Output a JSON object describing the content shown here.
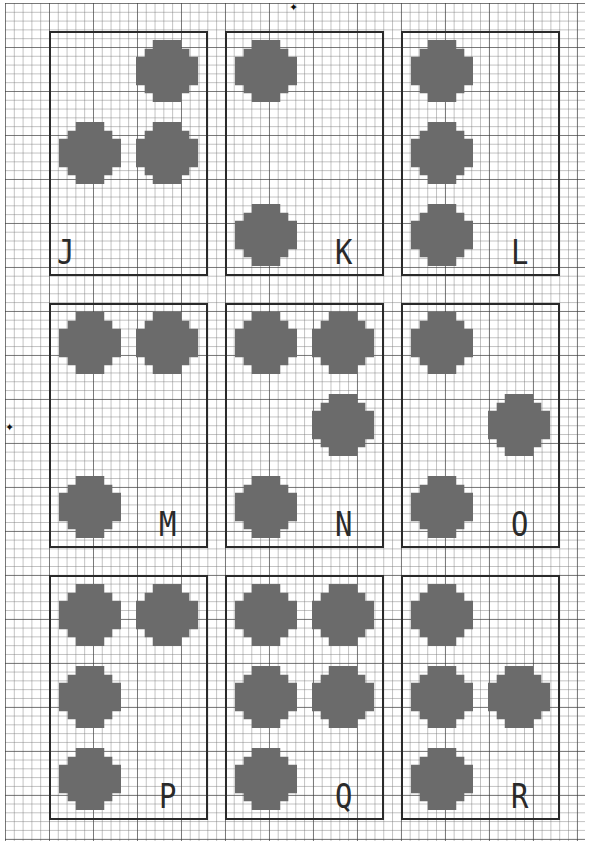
{
  "colors": {
    "dot": "#6b6b6b",
    "box_border": "#2a2a2a",
    "grid_major": "#3c3c3c",
    "grid_minor": "#787878"
  },
  "markers": {
    "top_center": "✦",
    "left_center": "✦"
  },
  "cells": [
    {
      "letter": "J",
      "col": 0,
      "row": 0,
      "dots": [
        4,
        2,
        5
      ]
    },
    {
      "letter": "K",
      "col": 1,
      "row": 0,
      "dots": [
        1,
        3
      ]
    },
    {
      "letter": "L",
      "col": 2,
      "row": 0,
      "dots": [
        1,
        2,
        3
      ]
    },
    {
      "letter": "M",
      "col": 0,
      "row": 1,
      "dots": [
        1,
        4,
        3
      ]
    },
    {
      "letter": "N",
      "col": 1,
      "row": 1,
      "dots": [
        1,
        4,
        5,
        3
      ]
    },
    {
      "letter": "O",
      "col": 2,
      "row": 1,
      "dots": [
        1,
        5,
        3
      ]
    },
    {
      "letter": "P",
      "col": 0,
      "row": 2,
      "dots": [
        1,
        4,
        2,
        3
      ]
    },
    {
      "letter": "Q",
      "col": 1,
      "row": 2,
      "dots": [
        1,
        4,
        2,
        5,
        3
      ]
    },
    {
      "letter": "R",
      "col": 2,
      "row": 2,
      "dots": [
        1,
        2,
        5,
        3
      ]
    }
  ]
}
